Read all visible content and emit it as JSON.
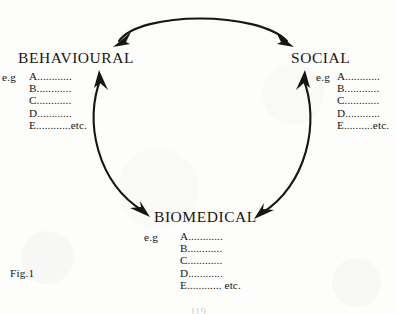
{
  "figure": {
    "caption": "Fig.1",
    "page_number": "119"
  },
  "nodes": [
    {
      "id": "behavioural",
      "title": "BEHAVIOURAL",
      "eg_label": "e.g",
      "items": [
        "A............",
        "B............",
        "C............",
        "D............",
        "E............etc."
      ]
    },
    {
      "id": "social",
      "title": "SOCIAL",
      "eg_label": "e.g",
      "items": [
        "A............",
        "B............",
        "C............",
        "D............",
        "E..........etc."
      ]
    },
    {
      "id": "biomedical",
      "title": "BIOMEDICAL",
      "eg_label": "e.g",
      "items": [
        "A............",
        "B............",
        "C............",
        "D............",
        "E............ etc."
      ]
    }
  ],
  "arrows": [
    {
      "id": "behavioural-social",
      "from": "BEHAVIOURAL",
      "to": "SOCIAL",
      "direction": "bidirectional",
      "position": "top"
    },
    {
      "id": "biomedical-behavioural",
      "from": "BIOMEDICAL",
      "to": "BEHAVIOURAL",
      "direction": "bidirectional",
      "position": "left"
    },
    {
      "id": "social-biomedical",
      "from": "SOCIAL",
      "to": "BIOMEDICAL",
      "direction": "bidirectional",
      "position": "right"
    }
  ],
  "colors": {
    "ink": "#17150f",
    "paper": "#fdfdfc",
    "page_number": "#d2d2cf"
  }
}
